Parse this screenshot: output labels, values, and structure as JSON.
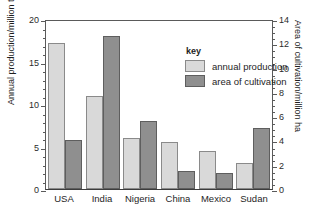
{
  "chart_data": {
    "type": "bar",
    "title": "",
    "categories": [
      "USA",
      "India",
      "Nigeria",
      "China",
      "Mexico",
      "Sudan"
    ],
    "series": [
      {
        "name": "annual production",
        "axis": "left",
        "unit": "million tonnes",
        "color": "#d9d9d9",
        "values": [
          17.2,
          11.0,
          6.0,
          5.5,
          4.5,
          3.1
        ]
      },
      {
        "name": "area of cultivation",
        "axis": "right",
        "unit": "million ha",
        "color": "#8f8f8f",
        "values": [
          4.0,
          12.6,
          5.6,
          1.5,
          1.3,
          5.0
        ]
      }
    ],
    "xlabel": "",
    "ylabel": "Annual production/million tonnes",
    "y2label": "Area of cultivation/million ha",
    "ylim": [
      0,
      20
    ],
    "y2lim": [
      0,
      14
    ],
    "yticks": [
      0,
      5,
      10,
      15,
      20
    ],
    "y2ticks": [
      0,
      2,
      4,
      6,
      8,
      10,
      12,
      14
    ],
    "y_minor_step": 1,
    "y2_minor_step": 0.5,
    "grid": false,
    "legend_position": "inside-top-center",
    "legend_title": "key"
  },
  "axes": {
    "left_title": "Annual production/million tonnes",
    "right_title": "Area of cultivation/million ha",
    "left_ticklabels": [
      "0",
      "5",
      "10",
      "15",
      "20"
    ],
    "right_ticklabels": [
      "0",
      "2",
      "4",
      "6",
      "8",
      "10",
      "12",
      "14"
    ]
  },
  "legend": {
    "title": "key",
    "entries": [
      {
        "label": "annual production",
        "color": "#d9d9d9"
      },
      {
        "label": "area of cultivation",
        "color": "#8f8f8f"
      }
    ]
  },
  "title_strip": {
    "text": ""
  }
}
